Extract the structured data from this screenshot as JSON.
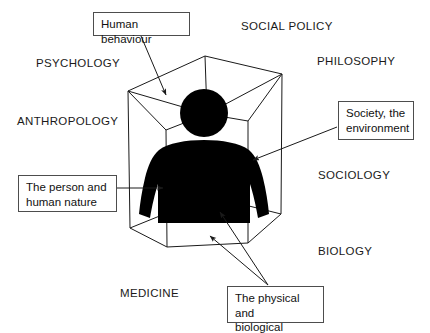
{
  "diagram": {
    "stroke_color": "#1a1a1a",
    "figure_color": "#000000",
    "background_color": "#ffffff",
    "box_border_color": "#4d4d4d"
  },
  "disciplines": [
    {
      "id": "psychology",
      "label": "PSYCHOLOGY",
      "x": 36,
      "y": 57
    },
    {
      "id": "social-policy",
      "label": "SOCIAL POLICY",
      "x": 241,
      "y": 20
    },
    {
      "id": "philosophy",
      "label": "PHILOSOPHY",
      "x": 317,
      "y": 55
    },
    {
      "id": "anthropology",
      "label": "ANTHROPOLOGY",
      "x": 17,
      "y": 115
    },
    {
      "id": "sociology",
      "label": "SOCIOLOGY",
      "x": 318,
      "y": 169
    },
    {
      "id": "biology",
      "label": "BIOLOGY",
      "x": 318,
      "y": 245
    },
    {
      "id": "medicine",
      "label": "MEDICINE",
      "x": 120,
      "y": 287
    }
  ],
  "callouts": [
    {
      "id": "human-behaviour",
      "text": "Human behaviour",
      "x": 93,
      "y": 12,
      "width": 97,
      "height": 24
    },
    {
      "id": "society-environment",
      "text": "Society, the\nenvironment",
      "x": 338,
      "y": 101,
      "width": 76,
      "height": 39
    },
    {
      "id": "person-human-nature",
      "text": "The person and\nhuman nature",
      "x": 18,
      "y": 175,
      "width": 99,
      "height": 37
    },
    {
      "id": "physical-biological-person",
      "text": "The physical and\nbiological person",
      "x": 227,
      "y": 286,
      "width": 97,
      "height": 37
    }
  ],
  "icons": {
    "person": "person-silhouette-icon",
    "box": "transparent-cube-icon",
    "arrow": "arrow-pointer-icon"
  }
}
